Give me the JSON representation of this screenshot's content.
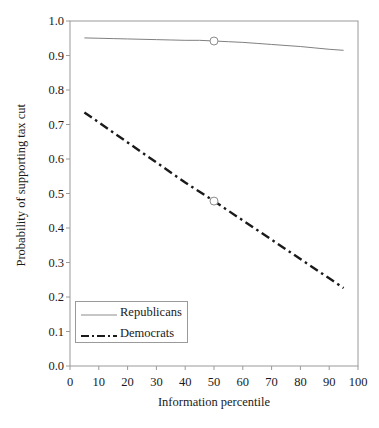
{
  "chart_data": {
    "type": "line",
    "title": "",
    "xlabel": "Information percentile",
    "ylabel": "Probability of supporting tax cut",
    "xlim": [
      0,
      100
    ],
    "ylim": [
      0.0,
      1.0
    ],
    "grid": false,
    "legend_position": "lower-left-inside",
    "xticks": [
      "0",
      "10",
      "20",
      "30",
      "40",
      "50",
      "60",
      "70",
      "80",
      "90",
      "100"
    ],
    "xtick_values": [
      0,
      10,
      20,
      30,
      40,
      50,
      60,
      70,
      80,
      90,
      100
    ],
    "yticks": [
      "0.0",
      "0.1",
      "0.2",
      "0.3",
      "0.4",
      "0.5",
      "0.6",
      "0.7",
      "0.8",
      "0.9",
      "1.0"
    ],
    "ytick_values": [
      0.0,
      0.1,
      0.2,
      0.3,
      0.4,
      0.5,
      0.6,
      0.7,
      0.8,
      0.9,
      1.0
    ],
    "x": [
      5,
      10,
      15,
      20,
      25,
      30,
      35,
      40,
      45,
      50,
      55,
      60,
      65,
      70,
      75,
      80,
      85,
      90,
      95
    ],
    "series": [
      {
        "name": "Republicans",
        "style": "solid",
        "color": "#808080",
        "marker_at_x": 50,
        "marker_at_y": 0.942,
        "values": [
          0.951,
          0.95,
          0.949,
          0.948,
          0.947,
          0.946,
          0.945,
          0.944,
          0.944,
          0.942,
          0.94,
          0.938,
          0.935,
          0.932,
          0.929,
          0.926,
          0.922,
          0.918,
          0.915
        ]
      },
      {
        "name": "Democrats",
        "style": "dash-dot",
        "color": "#1a1a1a",
        "marker_at_x": 50,
        "marker_at_y": 0.478,
        "values": [
          0.735,
          0.706,
          0.677,
          0.648,
          0.619,
          0.59,
          0.561,
          0.532,
          0.505,
          0.478,
          0.45,
          0.422,
          0.394,
          0.366,
          0.338,
          0.31,
          0.282,
          0.254,
          0.226
        ]
      }
    ]
  },
  "legend": {
    "items": [
      {
        "label": "Republicans"
      },
      {
        "label": "Democrats"
      }
    ]
  },
  "axes": {
    "frame_color": "#9a9a9a"
  }
}
